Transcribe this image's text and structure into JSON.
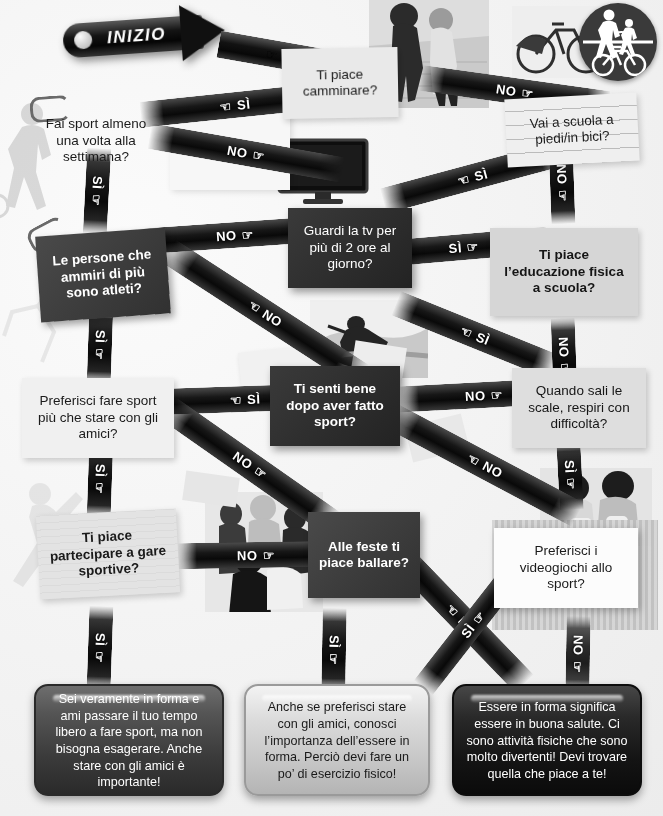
{
  "poster": {
    "start_label": "INIZIO",
    "start_pointer_icon": "pointing-hand-icon"
  },
  "questions": [
    {
      "id": "camminare",
      "text": "Ti piace camminare?"
    },
    {
      "id": "sport-sett",
      "text": "Fai sport almeno una volta alla settimana?"
    },
    {
      "id": "scuola-bici",
      "text": "Vai a scuola a piedi/in bici?"
    },
    {
      "id": "atleti",
      "text": "Le persone che ammiri di più sono atleti?"
    },
    {
      "id": "tv",
      "text": "Guardi la tv per più di 2 ore al giorno?"
    },
    {
      "id": "educazione",
      "text": "Ti piace l’educazione fisica a scuola?"
    },
    {
      "id": "senti-bene",
      "text": "Ti senti bene dopo aver fatto sport?"
    },
    {
      "id": "preferisci-sport",
      "text": "Preferisci fare sport più che stare con gli amici?"
    },
    {
      "id": "scale",
      "text": "Quando sali le scale, respiri con difficoltà?"
    },
    {
      "id": "gare",
      "text": "Ti piace partecipare a gare sportive?"
    },
    {
      "id": "ballare",
      "text": "Alle feste ti piace ballare?"
    },
    {
      "id": "videogiochi",
      "text": "Preferisci i videogiochi allo sport?"
    }
  ],
  "answers": {
    "yes": "SÌ",
    "no": "NO"
  },
  "connectors": [
    {
      "id": "start-to-camminare",
      "label": "",
      "from": "INIZIO",
      "to": "camminare"
    },
    {
      "id": "camminare-si",
      "label": "SÌ",
      "from": "camminare",
      "to": "sport-sett"
    },
    {
      "id": "camminare-no",
      "label": "NO",
      "from": "camminare",
      "to": "scuola-bici"
    },
    {
      "id": "sport-sett-no",
      "label": "NO",
      "from": "sport-sett",
      "to": "tv"
    },
    {
      "id": "sport-sett-si",
      "label": "SÌ",
      "from": "sport-sett",
      "to": "atleti"
    },
    {
      "id": "scuola-bici-si",
      "label": "SÌ",
      "from": "scuola-bici",
      "to": "tv"
    },
    {
      "id": "scuola-bici-no",
      "label": "NO",
      "from": "scuola-bici",
      "to": "educazione"
    },
    {
      "id": "tv-no",
      "label": "NO",
      "from": "tv",
      "to": "atleti"
    },
    {
      "id": "tv-si",
      "label": "SÌ",
      "from": "tv",
      "to": "educazione"
    },
    {
      "id": "atleti-no",
      "label": "NO",
      "from": "atleti",
      "to": "senti-bene"
    },
    {
      "id": "atleti-si",
      "label": "SÌ",
      "from": "atleti",
      "to": "preferisci-sport"
    },
    {
      "id": "educazione-si",
      "label": "SÌ",
      "from": "educazione",
      "to": "senti-bene"
    },
    {
      "id": "educazione-no",
      "label": "NO",
      "from": "educazione",
      "to": "scale"
    },
    {
      "id": "senti-bene-si",
      "label": "SÌ",
      "from": "senti-bene",
      "to": "preferisci-sport"
    },
    {
      "id": "senti-bene-no",
      "label": "NO",
      "from": "senti-bene",
      "to": "scale"
    },
    {
      "id": "preferisci-sport-si",
      "label": "SÌ",
      "from": "preferisci-sport",
      "to": "gare"
    },
    {
      "id": "preferisci-sport-no",
      "label": "NO",
      "from": "preferisci-sport",
      "to": "ballare"
    },
    {
      "id": "scale-si",
      "label": "SÌ",
      "from": "scale",
      "to": "videogiochi"
    },
    {
      "id": "scale-no",
      "label": "NO",
      "from": "scale",
      "to": "ballare"
    },
    {
      "id": "gare-no",
      "label": "NO",
      "from": "gare",
      "to": "ballare"
    },
    {
      "id": "gare-si",
      "label": "SÌ",
      "from": "gare",
      "to": "result-1"
    },
    {
      "id": "ballare-si",
      "label": "SÌ",
      "from": "ballare",
      "to": "result-2"
    },
    {
      "id": "ballare-no",
      "label": "NO",
      "from": "ballare",
      "to": "result-3"
    },
    {
      "id": "videogiochi-si",
      "label": "SÌ",
      "from": "videogiochi",
      "to": "result-3"
    },
    {
      "id": "videogiochi-no",
      "label": "NO",
      "from": "videogiochi",
      "to": "result-3"
    }
  ],
  "results": [
    {
      "id": "result-1",
      "text": "Sei veramente in forma e ami passare il tuo tempo libero a fare sport, ma non bisogna esagerare. Anche stare con gli amici è importante!"
    },
    {
      "id": "result-2",
      "text": "Anche se preferisci stare con gli amici, conosci l’importanza dell’essere in forma. Perciò devi fare un po’ di esercizio fisico!"
    },
    {
      "id": "result-3",
      "text": "Essere in forma significa essere in buona salute. Ci sono attività fisiche che sono molto divertenti! Devi trovare quella che piace a te!"
    }
  ],
  "icons": {
    "pointing_hand": "☞",
    "pointing_hand_left": "☜",
    "paperclip": "paperclip-icon",
    "ped_bike_sign": "pedestrian-and-bicycle-sign-icon",
    "tv": "television-icon"
  },
  "colors": {
    "ribbon_dark": "#121212",
    "card_dark": "#3c3c3c",
    "paper_light": "#e9e9e7",
    "page_bg": "#f4f4f4"
  }
}
